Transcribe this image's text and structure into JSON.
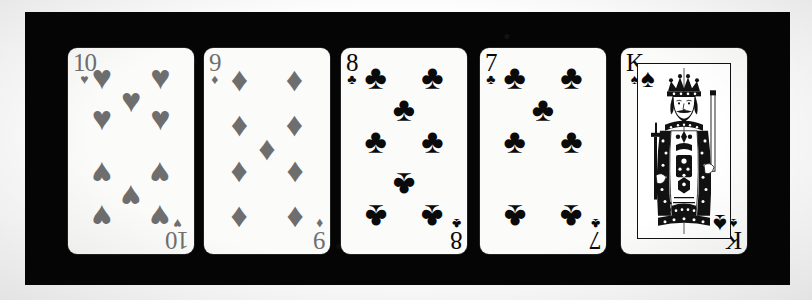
{
  "scene": {
    "description": "Photograph of five playing cards fanned in a row on a black background",
    "background_color": "#fdfdfd",
    "backdrop_color": "#050505",
    "card_face_color": "#fbfbfa",
    "red_suit_render_color": "#6e6e6e",
    "black_suit_render_color": "#0a0a0a"
  },
  "cards": [
    {
      "id": "card-10-hearts",
      "name": "10 of Hearts",
      "rank": "10",
      "suit": "hearts",
      "suit_glyph": "♥",
      "color_class": "red",
      "left": 68,
      "pip_count": 10,
      "pip_layout": [
        {
          "x": 16,
          "y": 11,
          "inv": false
        },
        {
          "x": 84,
          "y": 11,
          "inv": false
        },
        {
          "x": 50,
          "y": 23,
          "inv": false
        },
        {
          "x": 16,
          "y": 33,
          "inv": false
        },
        {
          "x": 84,
          "y": 33,
          "inv": false
        },
        {
          "x": 16,
          "y": 62,
          "inv": true
        },
        {
          "x": 84,
          "y": 62,
          "inv": true
        },
        {
          "x": 50,
          "y": 74,
          "inv": true
        },
        {
          "x": 16,
          "y": 85,
          "inv": true
        },
        {
          "x": 84,
          "y": 85,
          "inv": true
        }
      ]
    },
    {
      "id": "card-9-diamonds",
      "name": "9 of Diamonds",
      "rank": "9",
      "suit": "diamonds",
      "suit_glyph": "♦",
      "color_class": "red",
      "left": 204,
      "pip_count": 9,
      "pip_layout": [
        {
          "x": 18,
          "y": 12,
          "inv": false
        },
        {
          "x": 82,
          "y": 12,
          "inv": false
        },
        {
          "x": 18,
          "y": 36,
          "inv": false
        },
        {
          "x": 82,
          "y": 36,
          "inv": false
        },
        {
          "x": 50,
          "y": 49,
          "inv": false
        },
        {
          "x": 18,
          "y": 62,
          "inv": true
        },
        {
          "x": 82,
          "y": 62,
          "inv": true
        },
        {
          "x": 18,
          "y": 86,
          "inv": true
        },
        {
          "x": 82,
          "y": 86,
          "inv": true
        }
      ]
    },
    {
      "id": "card-8-clubs",
      "name": "8 of Clubs",
      "rank": "8",
      "suit": "clubs",
      "suit_glyph": "♣",
      "color_class": "black",
      "left": 341,
      "pip_count": 8,
      "pip_layout": [
        {
          "x": 17,
          "y": 11,
          "inv": false
        },
        {
          "x": 83,
          "y": 11,
          "inv": false
        },
        {
          "x": 50,
          "y": 28,
          "inv": false
        },
        {
          "x": 17,
          "y": 45,
          "inv": false
        },
        {
          "x": 83,
          "y": 45,
          "inv": false
        },
        {
          "x": 50,
          "y": 68,
          "inv": true
        },
        {
          "x": 17,
          "y": 85,
          "inv": true
        },
        {
          "x": 83,
          "y": 85,
          "inv": true
        }
      ]
    },
    {
      "id": "card-7-clubs",
      "name": "7 of Clubs",
      "rank": "7",
      "suit": "clubs",
      "suit_glyph": "♣",
      "color_class": "black",
      "left": 480,
      "pip_count": 7,
      "pip_layout": [
        {
          "x": 17,
          "y": 11,
          "inv": false
        },
        {
          "x": 83,
          "y": 11,
          "inv": false
        },
        {
          "x": 50,
          "y": 28,
          "inv": false
        },
        {
          "x": 17,
          "y": 45,
          "inv": false
        },
        {
          "x": 83,
          "y": 45,
          "inv": false
        },
        {
          "x": 17,
          "y": 85,
          "inv": true
        },
        {
          "x": 83,
          "y": 85,
          "inv": true
        }
      ]
    },
    {
      "id": "card-king-spades",
      "name": "King of Spades",
      "rank": "K",
      "suit": "spades",
      "suit_glyph": "♠",
      "color_class": "black",
      "left": 621,
      "is_court": true,
      "pip_count": 0,
      "pip_layout": []
    }
  ]
}
